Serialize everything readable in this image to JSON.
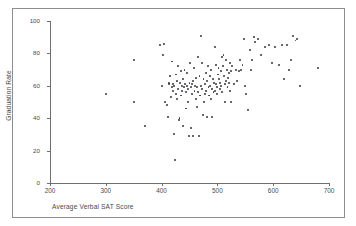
{
  "figure": {
    "frame_color": "#8d8d8d",
    "axis_color": "#6f6f6f",
    "point_color": "#39393f",
    "background": "#ffffff",
    "top_artifact_text": ""
  },
  "chart_data": {
    "type": "scatter",
    "title": "",
    "xlabel": "Average Verbal SAT Score",
    "ylabel": "Graduation Rate",
    "xlim": [
      200,
      700
    ],
    "ylim": [
      0,
      100
    ],
    "xticks": [
      200,
      300,
      400,
      500,
      600,
      700
    ],
    "yticks": [
      0,
      20,
      40,
      60,
      80,
      100
    ],
    "xtick_labels": [
      "200",
      "300",
      "400",
      "500",
      "600",
      "700"
    ],
    "ytick_labels": [
      "0",
      "20",
      "40",
      "60",
      "80",
      "100"
    ],
    "grid": false,
    "legend": null,
    "marker": "dot",
    "n_points": 152,
    "points": [
      [
        300,
        55
      ],
      [
        350,
        76
      ],
      [
        350,
        50
      ],
      [
        370,
        35
      ],
      [
        397,
        85
      ],
      [
        400,
        60
      ],
      [
        403,
        79
      ],
      [
        405,
        86
      ],
      [
        406,
        50
      ],
      [
        409,
        48
      ],
      [
        411,
        41
      ],
      [
        413,
        62
      ],
      [
        414,
        61
      ],
      [
        415,
        66
      ],
      [
        417,
        53
      ],
      [
        418,
        59
      ],
      [
        419,
        75
      ],
      [
        420,
        61
      ],
      [
        421,
        57
      ],
      [
        422,
        30
      ],
      [
        423,
        60
      ],
      [
        424,
        14
      ],
      [
        425,
        55
      ],
      [
        426,
        67
      ],
      [
        427,
        63
      ],
      [
        428,
        52
      ],
      [
        429,
        58
      ],
      [
        430,
        72
      ],
      [
        431,
        39
      ],
      [
        432,
        40
      ],
      [
        433,
        62
      ],
      [
        434,
        54
      ],
      [
        435,
        69
      ],
      [
        436,
        60
      ],
      [
        437,
        57
      ],
      [
        438,
        35
      ],
      [
        439,
        64
      ],
      [
        440,
        59
      ],
      [
        441,
        70
      ],
      [
        442,
        61
      ],
      [
        443,
        46
      ],
      [
        444,
        56
      ],
      [
        445,
        68
      ],
      [
        446,
        60
      ],
      [
        447,
        50
      ],
      [
        448,
        58
      ],
      [
        449,
        29
      ],
      [
        450,
        62
      ],
      [
        451,
        74
      ],
      [
        452,
        34
      ],
      [
        453,
        59
      ],
      [
        454,
        61
      ],
      [
        455,
        55
      ],
      [
        456,
        29
      ],
      [
        457,
        63
      ],
      [
        458,
        71
      ],
      [
        459,
        57
      ],
      [
        460,
        60
      ],
      [
        461,
        52
      ],
      [
        462,
        65
      ],
      [
        463,
        47
      ],
      [
        464,
        59
      ],
      [
        465,
        78
      ],
      [
        466,
        56
      ],
      [
        467,
        29
      ],
      [
        468,
        66
      ],
      [
        469,
        54
      ],
      [
        470,
        91
      ],
      [
        471,
        60
      ],
      [
        472,
        74
      ],
      [
        473,
        58
      ],
      [
        474,
        42
      ],
      [
        475,
        64
      ],
      [
        476,
        50
      ],
      [
        477,
        61
      ],
      [
        478,
        55
      ],
      [
        479,
        68
      ],
      [
        480,
        57
      ],
      [
        481,
        41
      ],
      [
        482,
        63
      ],
      [
        483,
        72
      ],
      [
        484,
        59
      ],
      [
        485,
        54
      ],
      [
        486,
        66
      ],
      [
        487,
        60
      ],
      [
        488,
        52
      ],
      [
        489,
        70
      ],
      [
        490,
        58
      ],
      [
        491,
        41
      ],
      [
        492,
        64
      ],
      [
        493,
        56
      ],
      [
        494,
        62
      ],
      [
        495,
        84
      ],
      [
        496,
        57
      ],
      [
        497,
        73
      ],
      [
        498,
        61
      ],
      [
        499,
        55
      ],
      [
        500,
        59
      ],
      [
        501,
        67
      ],
      [
        502,
        71
      ],
      [
        503,
        64
      ],
      [
        504,
        58
      ],
      [
        505,
        62
      ],
      [
        506,
        69
      ],
      [
        507,
        60
      ],
      [
        508,
        78
      ],
      [
        509,
        56
      ],
      [
        510,
        72
      ],
      [
        511,
        79
      ],
      [
        512,
        66
      ],
      [
        513,
        61
      ],
      [
        514,
        50
      ],
      [
        515,
        76
      ],
      [
        516,
        63
      ],
      [
        517,
        70
      ],
      [
        518,
        59
      ],
      [
        519,
        65
      ],
      [
        520,
        68
      ],
      [
        521,
        62
      ],
      [
        522,
        74
      ],
      [
        523,
        57
      ],
      [
        524,
        69
      ],
      [
        525,
        50
      ],
      [
        526,
        72
      ],
      [
        530,
        61
      ],
      [
        533,
        70
      ],
      [
        535,
        63
      ],
      [
        538,
        69
      ],
      [
        540,
        76
      ],
      [
        542,
        70
      ],
      [
        545,
        73
      ],
      [
        548,
        89
      ],
      [
        550,
        60
      ],
      [
        552,
        55
      ],
      [
        555,
        45
      ],
      [
        558,
        82
      ],
      [
        560,
        70
      ],
      [
        562,
        76
      ],
      [
        565,
        90
      ],
      [
        568,
        87
      ],
      [
        572,
        89
      ],
      [
        578,
        79
      ],
      [
        585,
        84
      ],
      [
        592,
        85
      ],
      [
        598,
        74
      ],
      [
        604,
        84
      ],
      [
        610,
        73
      ],
      [
        615,
        85
      ],
      [
        620,
        64
      ],
      [
        624,
        85
      ],
      [
        628,
        70
      ],
      [
        632,
        76
      ],
      [
        636,
        91
      ],
      [
        640,
        88
      ],
      [
        643,
        89
      ],
      [
        648,
        60
      ],
      [
        680,
        71
      ]
    ]
  }
}
